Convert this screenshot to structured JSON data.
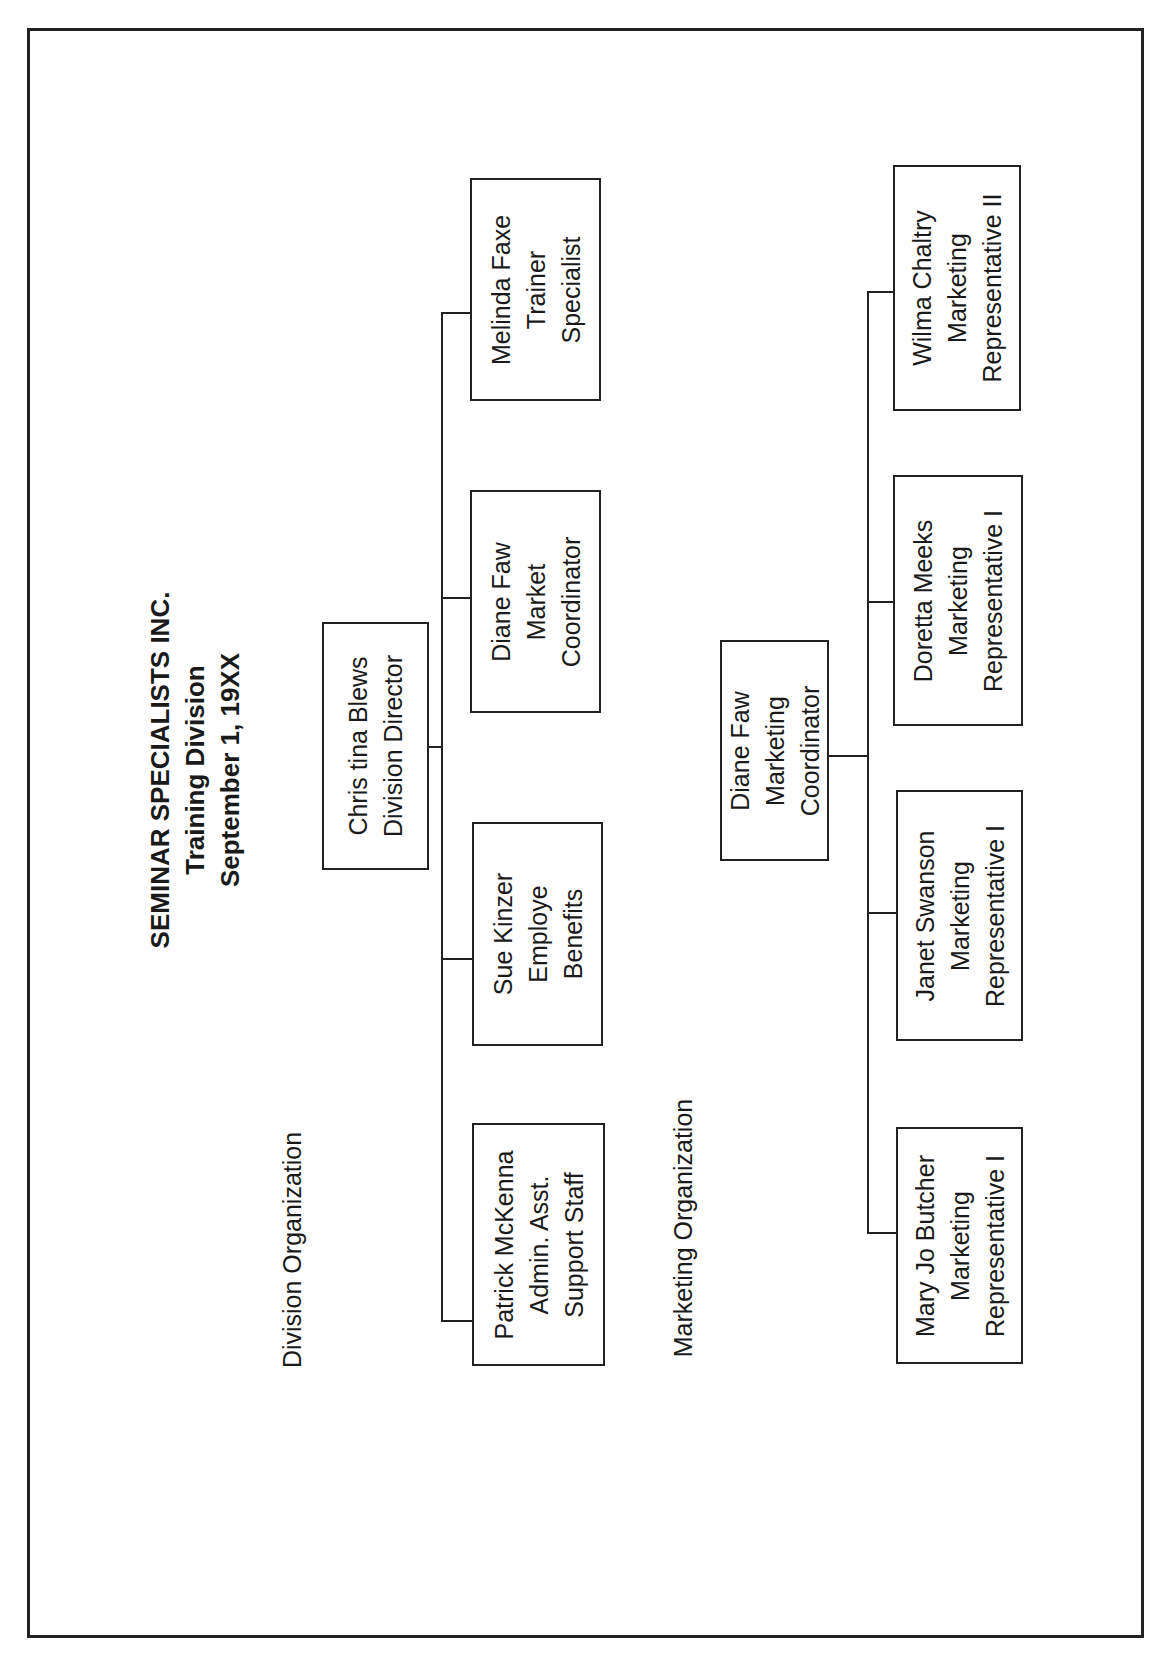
{
  "title": {
    "company": "SEMINAR SPECIALISTS INC.",
    "division": "Training Division",
    "date": "September 1, 19XX"
  },
  "sections": {
    "division_label": "Division Organization",
    "marketing_label": "Marketing Organization"
  },
  "division": {
    "head": {
      "name": "Chris tina Blews",
      "role": [
        "Division Director"
      ]
    },
    "reports": [
      {
        "name": "Melinda Faxe",
        "role": [
          "Trainer",
          "Specialist"
        ]
      },
      {
        "name": "Diane Faw",
        "role": [
          "Market",
          "Coordinator"
        ]
      },
      {
        "name": "Sue Kinzer",
        "role": [
          "Employe",
          "Benefits"
        ]
      },
      {
        "name": "Patrick McKenna",
        "role": [
          "Admin. Asst.",
          "Support Staff"
        ]
      }
    ]
  },
  "marketing": {
    "head": {
      "name": "Diane Faw",
      "role": [
        "Marketing",
        "Coordinator"
      ]
    },
    "reports": [
      {
        "name": "Wilma Chaltry",
        "role": [
          "Marketing",
          "Representative II"
        ]
      },
      {
        "name": "Doretta Meeks",
        "role": [
          "Marketing",
          "Representative I"
        ]
      },
      {
        "name": "Janet Swanson",
        "role": [
          "Marketing",
          "Representative I"
        ]
      },
      {
        "name": "Mary Jo Butcher",
        "role": [
          "Marketing",
          "Representative I"
        ]
      }
    ]
  }
}
